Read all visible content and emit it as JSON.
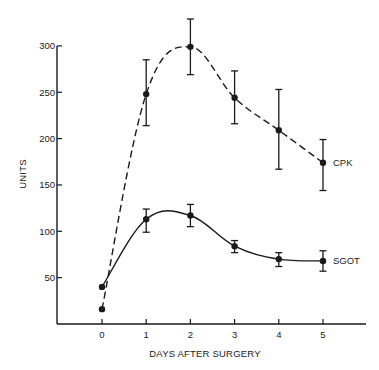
{
  "chart_data": {
    "type": "line",
    "title": "",
    "xlabel": "DAYS AFTER SURGERY",
    "ylabel": "UNITS",
    "x": [
      0,
      1,
      2,
      3,
      4,
      5
    ],
    "xticks": [
      "0",
      "1",
      "2",
      "3",
      "4",
      "5"
    ],
    "yticks": [
      "50",
      "100",
      "150",
      "200",
      "250",
      "300"
    ],
    "ylim": [
      0,
      300
    ],
    "xlim": [
      -1,
      6
    ],
    "grid": false,
    "legend": "inline labels at line ends",
    "series": [
      {
        "name": "CPK",
        "line_style": "dashed",
        "values": [
          16,
          248,
          299,
          244,
          209,
          174
        ],
        "error_high": [
          null,
          285,
          329,
          273,
          253,
          199
        ],
        "error_low": [
          null,
          214,
          269,
          216,
          167,
          144
        ]
      },
      {
        "name": "SGOT",
        "line_style": "solid",
        "values": [
          40,
          113,
          117,
          84,
          70,
          68
        ],
        "error_high": [
          null,
          124,
          129,
          90,
          77,
          79
        ],
        "error_low": [
          null,
          99,
          105,
          77,
          62,
          57
        ]
      }
    ]
  },
  "colors": {
    "ink": "#1a1a1a",
    "background": "#ffffff"
  }
}
